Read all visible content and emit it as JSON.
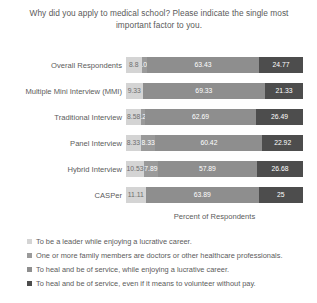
{
  "chart_data": {
    "type": "bar",
    "orientation": "horizontal",
    "stacked": true,
    "normalized_percent": true,
    "title": "Why did you apply to medical school? Please indicate the single most important factor to you.",
    "xlabel": "Percent of Respondents",
    "ylabel": "",
    "xlim": [
      0,
      100
    ],
    "grid": false,
    "legend_position": "bottom-left",
    "categories": [
      "Overall Respondents",
      "Multiple Mini Interview (MMI)",
      "Traditional Interview",
      "Panel Interview",
      "Hybrid Interview",
      "CASPer"
    ],
    "series": [
      {
        "name": "To be a leader while enjoying a lucrative career.",
        "color": "#d4d4d4",
        "values": [
          8.8,
          9.33,
          8.58,
          8.33,
          10.53,
          11.11
        ],
        "labels": [
          "8.8",
          "9.33",
          "8.58",
          "8.33",
          "10.53",
          "11.11"
        ]
      },
      {
        "name": "One or more family members are doctors or other healthcare professionals.",
        "color": "#9a9a9a",
        "values": [
          3.01,
          0,
          2.24,
          8.33,
          7.89,
          0
        ],
        "labels": [
          "3.01",
          "0",
          "2.24",
          "8.33",
          "7.89",
          "0"
        ]
      },
      {
        "name": "To heal and be of service, while enjoying a lucrative career.",
        "color": "#8e8e8e",
        "values": [
          63.43,
          69.33,
          62.69,
          60.42,
          57.89,
          63.89
        ],
        "labels": [
          "63.43",
          "69.33",
          "62.69",
          "60.42",
          "57.89",
          "63.89"
        ]
      },
      {
        "name": "To heal and be of service, even if it means to volunteer without pay.",
        "color": "#4d4d4d",
        "values": [
          24.77,
          21.33,
          26.49,
          22.92,
          26.68,
          25
        ],
        "labels": [
          "24.77",
          "21.33",
          "26.49",
          "22.92",
          "26.68",
          "25"
        ]
      }
    ]
  },
  "legend": {
    "items": [
      {
        "marker": "legend-marker-0",
        "label": "To be a leader while enjoying a lucrative career."
      },
      {
        "marker": "legend-marker-1",
        "label": "One or more family members are doctors or other healthcare professionals."
      },
      {
        "marker": "legend-marker-2",
        "label": "To heal and be of service, while enjoying a lucrative career."
      },
      {
        "marker": "legend-marker-3",
        "label": "To heal and be of service, even if it means to volunteer without pay."
      }
    ]
  }
}
